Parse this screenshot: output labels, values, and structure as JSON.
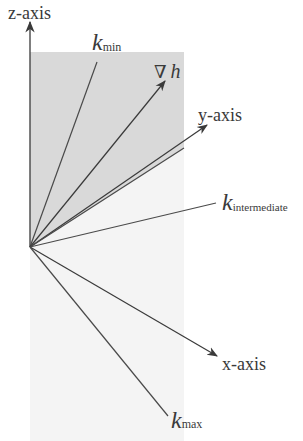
{
  "diagram": {
    "labels": {
      "z_axis": "z-axis",
      "y_axis": "y-axis",
      "x_axis": "x-axis",
      "k_min_base": "k",
      "k_min_sub": "min",
      "grad_h_nabla": "∇",
      "grad_h_var": "h",
      "k_intermediate_base": "k",
      "k_intermediate_sub": "intermediate",
      "k_max_base": "k",
      "k_max_sub": "max"
    },
    "colors": {
      "line": "#4a4a4a",
      "shade_dark": "#d9d9d9",
      "shade_light": "#f2f2f2",
      "text": "#3a3a3a"
    },
    "footer_text": "                                                                  "
  }
}
